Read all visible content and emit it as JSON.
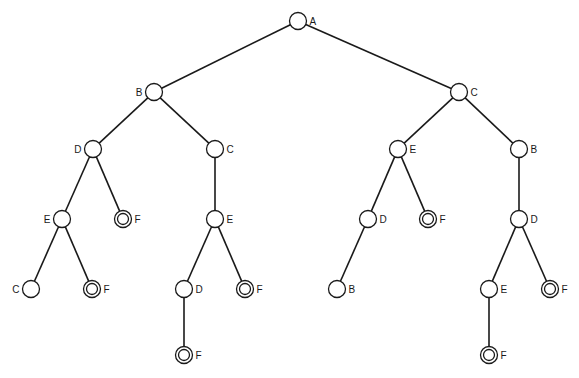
{
  "diagram": {
    "type": "search-tree",
    "root": "n1",
    "nodes": [
      {
        "id": "n1",
        "label": "A",
        "parent": null,
        "goal": false,
        "label_side": "right"
      },
      {
        "id": "n2",
        "label": "B",
        "parent": "n1",
        "goal": false,
        "label_side": "left"
      },
      {
        "id": "n3",
        "label": "C",
        "parent": "n1",
        "goal": false,
        "label_side": "right"
      },
      {
        "id": "n4",
        "label": "D",
        "parent": "n2",
        "goal": false,
        "label_side": "left"
      },
      {
        "id": "n5",
        "label": "C",
        "parent": "n2",
        "goal": false,
        "label_side": "right"
      },
      {
        "id": "n6",
        "label": "E",
        "parent": "n3",
        "goal": false,
        "label_side": "right"
      },
      {
        "id": "n7",
        "label": "B",
        "parent": "n3",
        "goal": false,
        "label_side": "right"
      },
      {
        "id": "n8",
        "label": "E",
        "parent": "n4",
        "goal": false,
        "label_side": "left"
      },
      {
        "id": "n9",
        "label": "F",
        "parent": "n4",
        "goal": true,
        "label_side": "right"
      },
      {
        "id": "n10",
        "label": "E",
        "parent": "n5",
        "goal": false,
        "label_side": "right"
      },
      {
        "id": "n11",
        "label": "D",
        "parent": "n6",
        "goal": false,
        "label_side": "right"
      },
      {
        "id": "n12",
        "label": "F",
        "parent": "n6",
        "goal": true,
        "label_side": "right"
      },
      {
        "id": "n13",
        "label": "D",
        "parent": "n7",
        "goal": false,
        "label_side": "right"
      },
      {
        "id": "n14",
        "label": "C",
        "parent": "n8",
        "goal": false,
        "label_side": "left"
      },
      {
        "id": "n15",
        "label": "F",
        "parent": "n8",
        "goal": true,
        "label_side": "right"
      },
      {
        "id": "n16",
        "label": "D",
        "parent": "n10",
        "goal": false,
        "label_side": "right"
      },
      {
        "id": "n17",
        "label": "F",
        "parent": "n10",
        "goal": true,
        "label_side": "right"
      },
      {
        "id": "n18",
        "label": "B",
        "parent": "n11",
        "goal": false,
        "label_side": "right"
      },
      {
        "id": "n19",
        "label": "E",
        "parent": "n13",
        "goal": false,
        "label_side": "right"
      },
      {
        "id": "n20",
        "label": "F",
        "parent": "n13",
        "goal": true,
        "label_side": "right"
      },
      {
        "id": "n21",
        "label": "F",
        "parent": "n16",
        "goal": true,
        "label_side": "right"
      },
      {
        "id": "n22",
        "label": "F",
        "parent": "n19",
        "goal": true,
        "label_side": "right"
      }
    ]
  }
}
